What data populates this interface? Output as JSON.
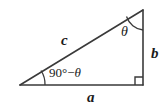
{
  "figure": {
    "background_color": "#ffffff",
    "stroke_color": "#3a3a3a",
    "labels": {
      "hypotenuse": "c",
      "vertical_leg": "b",
      "horizontal_leg": "a",
      "top_angle": "θ",
      "left_angle_prefix": "90°−",
      "left_angle_theta": "θ",
      "left_angle_full": "90°−θ"
    },
    "geometry": {
      "left_vertex": [
        20,
        85
      ],
      "bottom_right_vertex": [
        143,
        85
      ],
      "top_right_vertex": [
        143,
        10
      ],
      "right_angle_vertex": [
        143,
        85
      ],
      "right_angle_marker_size": 8
    },
    "icons": {
      "right_angle": "right-angle-marker",
      "top_arc": "angle-arc",
      "left_arc": "angle-arc"
    }
  }
}
